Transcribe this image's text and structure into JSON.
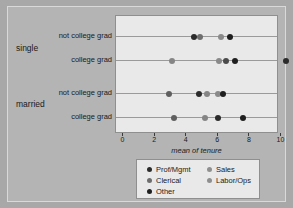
{
  "chart_data": {
    "type": "scatter",
    "title": "",
    "xlabel": "mean of tenure",
    "ylabel": "",
    "xlim": [
      0,
      11.2
    ],
    "xticks": [
      0,
      2,
      4,
      6,
      8,
      10
    ],
    "xtick_labels": [
      "0",
      "2",
      "4",
      "6",
      "8",
      "10"
    ],
    "grid": true,
    "legend_position": "below-plot",
    "group_labels": [
      "single",
      "married"
    ],
    "categories": [
      "not college grad",
      "college grad",
      "not college grad",
      "college grad"
    ],
    "series": [
      {
        "name": "Prof/Mgmt",
        "color": "#2b2b2b",
        "points": [
          {
            "row": "single / not college grad",
            "value": 4.5
          },
          {
            "row": "single / college grad",
            "value": 7.1
          },
          {
            "row": "single / college grad",
            "value": 10.6
          },
          {
            "row": "married / not college grad",
            "value": 4.8
          },
          {
            "row": "married / college grad",
            "value": 6.0
          }
        ]
      },
      {
        "name": "Clerical",
        "color": "#6e6e6e",
        "points": [
          {
            "row": "single / not college grad",
            "value": 5.2
          },
          {
            "row": "single / college grad",
            "value": 3.1
          },
          {
            "row": "married / not college grad",
            "value": 5.3
          },
          {
            "row": "married / college grad",
            "value": 5.2
          }
        ]
      },
      {
        "name": "Other",
        "color": "#1f1f1f",
        "points": [
          {
            "row": "single / not college grad",
            "value": 7.1
          },
          {
            "row": "single / college grad",
            "value": 6.5
          },
          {
            "row": "married / not college grad",
            "value": 6.3
          },
          {
            "row": "married / college grad",
            "value": 7.8
          }
        ]
      },
      {
        "name": "Sales",
        "color": "#8a8a8a",
        "points": [
          {
            "row": "single / not college grad",
            "value": 6.4
          },
          {
            "row": "single / college grad",
            "value": 6.0
          },
          {
            "row": "married / not college grad",
            "value": 6.1
          },
          {
            "row": "married / college grad",
            "value": 3.2
          }
        ]
      },
      {
        "name": "Labor/Ops",
        "color": "#7d7d7d",
        "points": [
          {
            "row": "single / not college grad",
            "value": 4.6
          },
          {
            "row": "single / college grad",
            "value": 6.3
          },
          {
            "row": "married / not college grad",
            "value": 3.1
          },
          {
            "row": "married / college grad",
            "value": 3.1
          }
        ]
      }
    ],
    "rows": [
      {
        "label": "not college grad",
        "group": "single",
        "dots": [
          {
            "value": 4.5,
            "series": "Prof/Mgmt",
            "color": "#2b2b2b"
          },
          {
            "value": 4.9,
            "series": "Labor/Ops",
            "color": "#6e6e6e"
          },
          {
            "value": 6.2,
            "series": "Sales",
            "color": "#8a8a8a"
          },
          {
            "value": 6.8,
            "series": "Other",
            "color": "#1f1f1f"
          }
        ]
      },
      {
        "label": "college grad",
        "group": "single",
        "dots": [
          {
            "value": 3.1,
            "series": "Clerical",
            "color": "#858585"
          },
          {
            "value": 6.1,
            "series": "Sales",
            "color": "#8a8a8a"
          },
          {
            "value": 6.5,
            "series": "Labor/Ops",
            "color": "#4a4a4a"
          },
          {
            "value": 7.1,
            "series": "Other",
            "color": "#1f1f1f"
          },
          {
            "value": 10.3,
            "series": "Prof/Mgmt",
            "color": "#2b2b2b"
          }
        ]
      },
      {
        "label": "not college grad",
        "group": "married",
        "dots": [
          {
            "value": 2.9,
            "series": "Labor/Ops",
            "color": "#5f5f5f"
          },
          {
            "value": 4.8,
            "series": "Prof/Mgmt",
            "color": "#2b2b2b"
          },
          {
            "value": 5.3,
            "series": "Clerical",
            "color": "#858585"
          },
          {
            "value": 6.0,
            "series": "Sales",
            "color": "#8a8a8a"
          },
          {
            "value": 6.3,
            "series": "Other",
            "color": "#1f1f1f"
          }
        ]
      },
      {
        "label": "college grad",
        "group": "married",
        "dots": [
          {
            "value": 3.2,
            "series": "Labor/Ops",
            "color": "#5f5f5f"
          },
          {
            "value": 5.2,
            "series": "Clerical",
            "color": "#858585"
          },
          {
            "value": 6.0,
            "series": "Prof/Mgmt",
            "color": "#2b2b2b"
          },
          {
            "value": 7.6,
            "series": "Other",
            "color": "#1f1f1f"
          }
        ]
      }
    ],
    "legend": [
      {
        "label": "Prof/Mgmt",
        "color": "#2b2b2b"
      },
      {
        "label": "Clerical",
        "color": "#6e6e6e"
      },
      {
        "label": "Other",
        "color": "#1f1f1f"
      },
      {
        "label": "Sales",
        "color": "#8f8f8f"
      },
      {
        "label": "Labor/Ops",
        "color": "#8f8f8f"
      }
    ]
  },
  "colors": {
    "figure_background": "#b4b4b4",
    "panel_background": "#e9e9e9",
    "grid_line": "#9a9a9a",
    "axis": "#3a3a3a",
    "text": "#1a1a1a"
  }
}
